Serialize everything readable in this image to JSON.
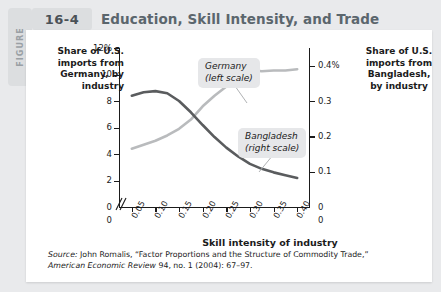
{
  "figure": {
    "tab_label": "FIGURE",
    "number": "16-4",
    "title": "Education, Skill Intensity, and Trade"
  },
  "axes": {
    "left_caption": "Share of U.S. imports from Germany, by industry",
    "right_caption": "Share of U.S. imports from Bangladesh, by industry",
    "xlabel": "Skill intensity of industry",
    "left_ticks": [
      "12%",
      "10",
      "8",
      "6",
      "4",
      "2",
      "0"
    ],
    "right_ticks": [
      "0.4%",
      "0.3",
      "0.2",
      "0.1",
      "0"
    ],
    "x_ticks": [
      "0.05",
      "0.10",
      "0.15",
      "0.20",
      "0.25",
      "0.30",
      "0.35",
      "0.40"
    ],
    "x_zero_left": "0",
    "x_zero_right": "0"
  },
  "legend": {
    "germany_line1": "Germany",
    "germany_line2": "(left scale)",
    "bangladesh_line1": "Bangladesh",
    "bangladesh_line2": "(right scale)"
  },
  "colors": {
    "germany_line": "#b9bbbd",
    "bangladesh_line": "#5a5c5e",
    "title_text": "#5b666d",
    "tab_bg": "#dcdee0",
    "callout_bg": "#e6e7e9",
    "page_bg": "#e9eaec",
    "card_bg": "#ffffff"
  },
  "source": {
    "prefix": "Source:",
    "line1": " John Romalis, “Factor Proportions and the Structure of Commodity Trade,”",
    "journal": "American Economic Review",
    "line2": " 94, no. 1 (2004): 67–97."
  },
  "chart_data": {
    "type": "line",
    "title": "Education, Skill Intensity, and Trade",
    "xlabel": "Skill intensity of industry",
    "ylabel": "Share of U.S. imports from Germany, by industry",
    "ylabel_right": "Share of U.S. imports from Bangladesh, by industry",
    "xlim": [
      0.025,
      0.425
    ],
    "ylim": [
      0,
      12
    ],
    "ylim_right": [
      0,
      0.45
    ],
    "grid": false,
    "legend_position": "inline-callout",
    "x": [
      0.05,
      0.075,
      0.1,
      0.125,
      0.15,
      0.175,
      0.2,
      0.225,
      0.25,
      0.275,
      0.3,
      0.325,
      0.35,
      0.375,
      0.4
    ],
    "series": [
      {
        "name": "Germany (left scale)",
        "axis": "left",
        "units": "percent",
        "color": "#b9bbbd",
        "values": [
          4.4,
          4.7,
          5.0,
          5.4,
          5.9,
          6.6,
          7.6,
          8.4,
          9.1,
          9.8,
          10.35,
          10.25,
          10.3,
          10.3,
          10.4
        ]
      },
      {
        "name": "Bangladesh (right scale)",
        "axis": "right",
        "units": "percent",
        "color": "#5a5c5e",
        "values": [
          0.315,
          0.325,
          0.328,
          0.322,
          0.3,
          0.268,
          0.232,
          0.198,
          0.168,
          0.143,
          0.122,
          0.108,
          0.098,
          0.09,
          0.082
        ]
      }
    ]
  }
}
